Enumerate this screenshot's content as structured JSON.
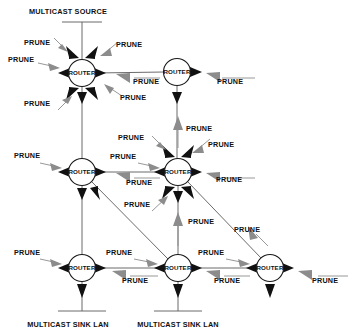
{
  "diagram": {
    "type": "network-topology",
    "canvas": {
      "width": 355,
      "height": 335
    },
    "colors": {
      "background": "#ffffff",
      "outgoing_arrow": "#111111",
      "prune_arrow": "#8c8c8c",
      "link_line": "#5a5a5a",
      "text": "#101010"
    },
    "labels": {
      "multicast_source": "MULTICAST SOURCE",
      "multicast_sink_lan": "MULTICAST SINK LAN",
      "router": "ROUTER",
      "prune": "PRUNE"
    },
    "routers": [
      {
        "id": "r1",
        "label": "ROUTER",
        "cx": 82,
        "cy": 73,
        "r": 13.5,
        "row": "top",
        "col": "left"
      },
      {
        "id": "r2",
        "label": "ROUTER",
        "cx": 177,
        "cy": 72,
        "r": 13.5,
        "row": "top",
        "col": "center"
      },
      {
        "id": "r3",
        "label": "ROUTER",
        "cx": 82,
        "cy": 172,
        "r": 13.5,
        "row": "middle",
        "col": "left"
      },
      {
        "id": "r4",
        "label": "ROUTER",
        "cx": 178,
        "cy": 172,
        "r": 13.5,
        "row": "middle",
        "col": "center"
      },
      {
        "id": "r5",
        "label": "ROUTER",
        "cx": 82,
        "cy": 268,
        "r": 13.5,
        "row": "bottom",
        "col": "left"
      },
      {
        "id": "r6",
        "label": "ROUTER",
        "cx": 178,
        "cy": 268,
        "r": 13.5,
        "row": "bottom",
        "col": "center"
      },
      {
        "id": "r7",
        "label": "ROUTER",
        "cx": 270,
        "cy": 268,
        "r": 13.5,
        "row": "bottom",
        "col": "right"
      }
    ],
    "lans": [
      {
        "id": "source-lan",
        "label": "MULTICAST SOURCE",
        "label_x": 68,
        "label_y": 14,
        "bar_y": 22,
        "bar_x1": 62,
        "bar_x2": 102,
        "stem_x": 82
      },
      {
        "id": "sink-lan-left",
        "label": "MULTICAST SINK LAN",
        "label_x": 25,
        "label_y": 327,
        "bar_y": 311,
        "bar_x1": 58,
        "bar_x2": 106,
        "stem_x": 82
      },
      {
        "id": "sink-lan-center",
        "label": "MULTICAST SINK LAN",
        "label_x": 122,
        "label_y": 327,
        "bar_y": 311,
        "bar_x1": 154,
        "bar_x2": 202,
        "stem_x": 178
      }
    ],
    "prune_labels": [
      {
        "text": "PRUNE",
        "x": 24,
        "y": 45
      },
      {
        "text": "PRUNE",
        "x": 8,
        "y": 62
      },
      {
        "text": "PRUNE",
        "x": 116,
        "y": 47
      },
      {
        "text": "PRUNE",
        "x": 133,
        "y": 82
      },
      {
        "text": "PRUNE",
        "x": 120,
        "y": 100
      },
      {
        "text": "PRUNE",
        "x": 24,
        "y": 104
      },
      {
        "text": "PRUNE",
        "x": 217,
        "y": 82
      },
      {
        "text": "PRUNE",
        "x": 120,
        "y": 139
      },
      {
        "text": "PRUNE",
        "x": 188,
        "y": 131
      },
      {
        "text": "PRUNE",
        "x": 208,
        "y": 147
      },
      {
        "text": "PRUNE",
        "x": 14,
        "y": 158
      },
      {
        "text": "PRUNE",
        "x": 112,
        "y": 159
      },
      {
        "text": "PRUNE",
        "x": 124,
        "y": 184
      },
      {
        "text": "PRUNE",
        "x": 214,
        "y": 181
      },
      {
        "text": "PRUNE",
        "x": 124,
        "y": 204
      },
      {
        "text": "PRUNE",
        "x": 190,
        "y": 223
      },
      {
        "text": "PRUNE",
        "x": 234,
        "y": 231
      },
      {
        "text": "PRUNE",
        "x": 14,
        "y": 255
      },
      {
        "text": "PRUNE",
        "x": 108,
        "y": 255
      },
      {
        "text": "PRUNE",
        "x": 122,
        "y": 282
      },
      {
        "text": "PRUNE",
        "x": 202,
        "y": 255
      },
      {
        "text": "PRUNE",
        "x": 214,
        "y": 282
      },
      {
        "text": "PRUNE",
        "x": 312,
        "y": 282
      }
    ]
  }
}
